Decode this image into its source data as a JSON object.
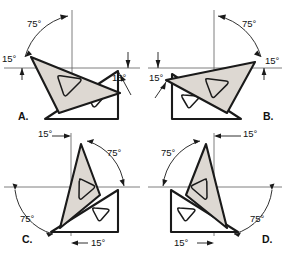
{
  "figure": {
    "background_color": "#ffffff",
    "line_color": "#1a1a1a",
    "axis_color": "#5d5d5d",
    "shade_color": "#ddd8d2",
    "width": 286,
    "height": 257
  },
  "panels": [
    {
      "id": "A",
      "letter": "A.",
      "letter_pos": {
        "x": 18,
        "y": 120
      },
      "labels": [
        {
          "name": "angle-75-label",
          "text": "75°",
          "x": 27,
          "y": 27
        },
        {
          "name": "angle-15-left-label",
          "text": "15°",
          "x": 2,
          "y": 62
        },
        {
          "name": "angle-15-right-label",
          "text": "15°",
          "x": 112,
          "y": 81
        }
      ],
      "shaded_triangle": [
        [
          31,
          57
        ],
        [
          120,
          93
        ],
        [
          59,
          113
        ]
      ],
      "plain_triangle": [
        [
          45,
          119
        ],
        [
          118,
          119
        ],
        [
          118,
          71
        ]
      ],
      "shaded_hole": [
        [
          58,
          76
        ],
        [
          81,
          79
        ],
        [
          64,
          94
        ]
      ],
      "plain_hole": [
        [
          88,
          95
        ],
        [
          104,
          95
        ],
        [
          94,
          107
        ]
      ],
      "vertical_axis": {
        "x": 72,
        "y1": 10,
        "y2": 92
      },
      "horizontal_axis": {
        "y": 68,
        "x1": 4,
        "x2": 140
      }
    },
    {
      "id": "B",
      "letter": "B.",
      "letter_pos": {
        "x": 263,
        "y": 120
      },
      "labels": [
        {
          "name": "angle-75-label",
          "text": "75°",
          "x": 242,
          "y": 27
        },
        {
          "name": "angle-15-right-label",
          "text": "15°",
          "x": 265,
          "y": 64
        },
        {
          "name": "angle-15-left-label",
          "text": "15°",
          "x": 149,
          "y": 81
        }
      ],
      "shaded_triangle": [
        [
          255,
          62
        ],
        [
          166,
          80
        ],
        [
          227,
          113
        ]
      ],
      "plain_triangle": [
        [
          172,
          119
        ],
        [
          241,
          119
        ],
        [
          172,
          74
        ]
      ],
      "shaded_hole": [
        [
          206,
          79
        ],
        [
          228,
          79
        ],
        [
          212,
          94
        ]
      ],
      "plain_hole": [
        [
          182,
          95
        ],
        [
          200,
          95
        ],
        [
          186,
          107
        ]
      ],
      "vertical_axis": {
        "x": 214,
        "y1": 10,
        "y2": 92
      },
      "horizontal_axis": {
        "y": 68,
        "x1": 148,
        "x2": 282
      }
    },
    {
      "id": "C",
      "letter": "C.",
      "letter_pos": {
        "x": 22,
        "y": 243
      },
      "labels": [
        {
          "name": "angle-15-top-label",
          "text": "15°",
          "x": 38,
          "y": 137
        },
        {
          "name": "angle-75-right-label",
          "text": "75°",
          "x": 107,
          "y": 156
        },
        {
          "name": "angle-75-left-label",
          "text": "75°",
          "x": 20,
          "y": 222
        },
        {
          "name": "angle-15-bottom-label",
          "text": "15°",
          "x": 91,
          "y": 246
        }
      ],
      "shaded_triangle": [
        [
          81,
          144
        ],
        [
          100,
          195
        ],
        [
          60,
          228
        ]
      ],
      "plain_triangle": [
        [
          51,
          232
        ],
        [
          118,
          232
        ],
        [
          118,
          190
        ]
      ],
      "shaded_hole": [
        [
          79,
          180
        ],
        [
          92,
          186
        ],
        [
          76,
          198
        ]
      ],
      "plain_hole": [
        [
          93,
          208
        ],
        [
          109,
          208
        ],
        [
          98,
          220
        ]
      ],
      "vertical_axis": {
        "x": 71,
        "y1": 133,
        "y2": 236
      },
      "horizontal_axis": {
        "y": 187,
        "x1": 4,
        "x2": 140
      }
    },
    {
      "id": "D",
      "letter": "D.",
      "letter_pos": {
        "x": 262,
        "y": 243
      },
      "labels": [
        {
          "name": "angle-15-top-label",
          "text": "15°",
          "x": 243,
          "y": 137
        },
        {
          "name": "angle-75-left-label",
          "text": "75°",
          "x": 161,
          "y": 156
        },
        {
          "name": "angle-75-right-label",
          "text": "75°",
          "x": 250,
          "y": 222
        },
        {
          "name": "angle-15-bottom-label",
          "text": "15°",
          "x": 174,
          "y": 246
        }
      ],
      "shaded_triangle": [
        [
          206,
          144
        ],
        [
          186,
          195
        ],
        [
          227,
          228
        ]
      ],
      "plain_triangle": [
        [
          171,
          190
        ],
        [
          171,
          232
        ],
        [
          238,
          232
        ]
      ],
      "shaded_hole": [
        [
          195,
          180
        ],
        [
          209,
          186
        ],
        [
          193,
          198
        ]
      ],
      "plain_hole": [
        [
          178,
          208
        ],
        [
          195,
          208
        ],
        [
          182,
          220
        ]
      ],
      "vertical_axis": {
        "x": 214,
        "y1": 133,
        "y2": 236
      },
      "horizontal_axis": {
        "y": 187,
        "x1": 148,
        "x2": 282
      }
    }
  ],
  "angles": {
    "primary": "75°",
    "secondary": "15°"
  }
}
